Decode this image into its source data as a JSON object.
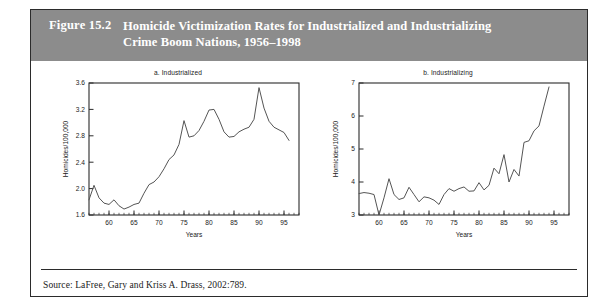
{
  "figure": {
    "number_label": "Figure 15.2",
    "title_line1": "Homicide Victimization Rates for Industrialized and Industrializing",
    "title_line2": "Crime Boom Nations, 1956–1998",
    "source": "Source: LaFree, Gary and Kriss A. Drass, 2002:789.",
    "header_color": "#8c8c8c",
    "line_color": "#555555",
    "frame_color": "#2b2b2b"
  },
  "chart_data": [
    {
      "type": "line",
      "title": "a. Industrialized",
      "xlabel": "Years",
      "ylabel": "Homicides/100,000",
      "xlim": [
        1956,
        1998
      ],
      "ylim": [
        1.6,
        3.6
      ],
      "xticks": [
        1960,
        1965,
        1970,
        1975,
        1980,
        1985,
        1990,
        1995
      ],
      "xticklabels": [
        "60",
        "65",
        "70",
        "75",
        "80",
        "85",
        "90",
        "95"
      ],
      "yticks": [
        1.6,
        2.0,
        2.4,
        2.8,
        3.2,
        3.6
      ],
      "yticklabels": [
        "1.6",
        "2.0",
        "2.4",
        "2.8",
        "3.2",
        "3.6"
      ],
      "grid": false,
      "legend": "none",
      "series": [
        {
          "name": "Industrialized homicide rate",
          "x": [
            1956,
            1957,
            1958,
            1959,
            1960,
            1961,
            1962,
            1963,
            1964,
            1965,
            1966,
            1967,
            1968,
            1969,
            1970,
            1971,
            1972,
            1973,
            1974,
            1975,
            1976,
            1977,
            1978,
            1979,
            1980,
            1981,
            1982,
            1983,
            1984,
            1985,
            1986,
            1987,
            1988,
            1989,
            1990,
            1991,
            1992,
            1993,
            1994,
            1995,
            1996
          ],
          "y": [
            1.83,
            2.05,
            1.86,
            1.78,
            1.76,
            1.83,
            1.74,
            1.69,
            1.72,
            1.76,
            1.78,
            1.93,
            2.06,
            2.1,
            2.18,
            2.3,
            2.44,
            2.51,
            2.67,
            3.03,
            2.78,
            2.8,
            2.88,
            3.02,
            3.19,
            3.2,
            3.05,
            2.86,
            2.78,
            2.79,
            2.86,
            2.9,
            2.93,
            3.05,
            3.53,
            3.22,
            3.02,
            2.93,
            2.89,
            2.85,
            2.73
          ]
        }
      ]
    },
    {
      "type": "line",
      "title": "b. Industrializing",
      "xlabel": "Years",
      "ylabel": "Homicides/100,000",
      "xlim": [
        1956,
        1998
      ],
      "ylim": [
        3,
        7
      ],
      "xticks": [
        1960,
        1965,
        1970,
        1975,
        1980,
        1985,
        1990,
        1995
      ],
      "xticklabels": [
        "60",
        "65",
        "70",
        "75",
        "80",
        "85",
        "90",
        "95"
      ],
      "yticks": [
        3,
        4,
        5,
        6,
        7
      ],
      "yticklabels": [
        "3",
        "4",
        "5",
        "6",
        "7"
      ],
      "grid": false,
      "legend": "none",
      "series": [
        {
          "name": "Industrializing homicide rate",
          "x": [
            1956,
            1957,
            1958,
            1959,
            1960,
            1961,
            1962,
            1963,
            1964,
            1965,
            1966,
            1967,
            1968,
            1969,
            1970,
            1971,
            1972,
            1973,
            1974,
            1975,
            1976,
            1977,
            1978,
            1979,
            1980,
            1981,
            1982,
            1983,
            1984,
            1985,
            1986,
            1987,
            1988,
            1989,
            1990,
            1991,
            1992,
            1993,
            1994
          ],
          "y": [
            3.65,
            3.68,
            3.66,
            3.62,
            3.0,
            3.52,
            4.1,
            3.62,
            3.47,
            3.52,
            3.84,
            3.62,
            3.4,
            3.55,
            3.52,
            3.45,
            3.32,
            3.62,
            3.8,
            3.72,
            3.8,
            3.85,
            3.72,
            3.73,
            3.98,
            3.76,
            3.9,
            4.42,
            4.25,
            4.83,
            4.0,
            4.38,
            4.18,
            5.2,
            5.25,
            5.55,
            5.7,
            6.3,
            6.88
          ]
        }
      ]
    }
  ]
}
